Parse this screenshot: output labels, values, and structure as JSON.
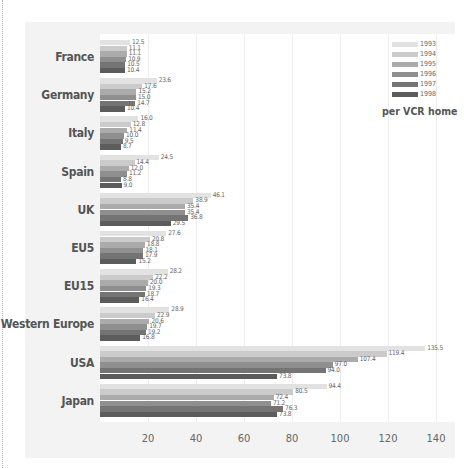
{
  "chart_data": {
    "type": "bar",
    "orientation": "horizontal",
    "title": "",
    "unit_label": "per VCR home",
    "xlabel": "",
    "ylabel": "",
    "xlim": [
      0,
      140
    ],
    "x_ticks": [
      "20",
      "40",
      "60",
      "80",
      "100",
      "120",
      "140"
    ],
    "grid": true,
    "legend_position": "top-right",
    "categories": [
      "France",
      "Germany",
      "Italy",
      "Spain",
      "UK",
      "EU5",
      "EU15",
      "Western Europe",
      "USA",
      "Japan"
    ],
    "series": [
      {
        "name": "1993",
        "color": "#e2e2e2",
        "values": [
          12.5,
          23.6,
          16.0,
          24.5,
          46.1,
          27.6,
          28.2,
          28.9,
          135.5,
          94.4
        ]
      },
      {
        "name": "1994",
        "color": "#cbcbcb",
        "values": [
          11.1,
          17.6,
          12.8,
          14.4,
          38.9,
          20.8,
          22.2,
          22.9,
          119.4,
          80.5
        ]
      },
      {
        "name": "1995",
        "color": "#ababab",
        "values": [
          11.1,
          15.2,
          11.4,
          12.0,
          35.4,
          18.8,
          20.0,
          20.6,
          107.4,
          72.4
        ]
      },
      {
        "name": "1996",
        "color": "#8f8f8f",
        "values": [
          10.9,
          15.0,
          10.0,
          11.2,
          35.4,
          18.1,
          19.3,
          19.7,
          97.0,
          71.2
        ]
      },
      {
        "name": "1997",
        "color": "#747474",
        "values": [
          10.5,
          14.7,
          9.5,
          8.8,
          36.8,
          17.9,
          18.7,
          19.2,
          94.0,
          76.3
        ]
      },
      {
        "name": "1998",
        "color": "#5c5c5c",
        "values": [
          10.4,
          10.4,
          8.7,
          9.0,
          29.5,
          15.2,
          16.4,
          16.8,
          73.8,
          73.8
        ]
      }
    ]
  }
}
